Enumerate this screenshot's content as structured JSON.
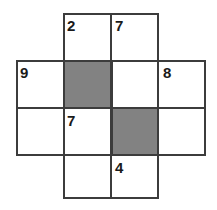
{
  "figure": {
    "name": "overlapping-blocks-number-puzzle",
    "width": 217,
    "height": 210,
    "background_color": "#ffffff",
    "line_color": "#3c3c3c",
    "dotted_line_color": "#6b6b6b",
    "shaded_cell_color": "#828282",
    "digit_color": "#1a1a1a",
    "cell_size": 47.5,
    "grid_columns": 4,
    "grid_rows": 4
  },
  "clues": [
    {
      "id": "clue-2",
      "value": "2",
      "row": 0,
      "col": 1,
      "x": 67,
      "y": 18
    },
    {
      "id": "clue-7-top",
      "value": "7",
      "row": 0,
      "col": 2,
      "x": 115,
      "y": 18
    },
    {
      "id": "clue-9",
      "value": "9",
      "row": 1,
      "col": 0,
      "x": 20,
      "y": 65
    },
    {
      "id": "clue-8",
      "value": "8",
      "row": 1,
      "col": 3,
      "x": 163,
      "y": 65
    },
    {
      "id": "clue-7-mid",
      "value": "7",
      "row": 2,
      "col": 1,
      "x": 67,
      "y": 113
    },
    {
      "id": "clue-4",
      "value": "4",
      "row": 3,
      "col": 2,
      "x": 115,
      "y": 160
    }
  ],
  "shaded_cells": [
    {
      "id": "shaded-cell-upper-left",
      "row": 1,
      "col": 1,
      "x": 63,
      "y": 60,
      "w": 48,
      "h": 48
    },
    {
      "id": "shaded-cell-lower-right",
      "row": 2,
      "col": 2,
      "x": 111,
      "y": 108,
      "w": 48,
      "h": 48
    }
  ],
  "blocks": [
    {
      "id": "block-top",
      "label": "top-block",
      "x": 63,
      "y": 13,
      "w": 96,
      "h": 96
    },
    {
      "id": "block-left",
      "label": "left-block",
      "x": 16,
      "y": 60,
      "w": 96,
      "h": 96
    },
    {
      "id": "block-right",
      "label": "right-block",
      "x": 111,
      "y": 60,
      "w": 95,
      "h": 96
    },
    {
      "id": "block-bottom",
      "label": "bottom-block",
      "x": 63,
      "y": 107,
      "w": 96,
      "h": 92
    }
  ],
  "solid_separators": [
    {
      "id": "sep-top-vertical",
      "orientation": "v",
      "x": 110,
      "y": 13,
      "len": 96
    },
    {
      "id": "sep-bottom-vertical",
      "orientation": "v",
      "x": 110,
      "y": 107,
      "len": 92
    },
    {
      "id": "sep-left-horizontal",
      "orientation": "h",
      "x": 16,
      "y": 107,
      "len": 96
    },
    {
      "id": "sep-right-horizontal",
      "orientation": "h",
      "x": 111,
      "y": 107,
      "len": 95
    }
  ],
  "dotted_separators": [
    {
      "id": "dot-left-horizontal",
      "orientation": "h",
      "x": 16,
      "y": 107,
      "len": 48
    },
    {
      "id": "dot-right-horizontal",
      "orientation": "h",
      "x": 110,
      "y": 60,
      "len": 96
    },
    {
      "id": "dot-bottom-horizontal",
      "orientation": "h",
      "x": 63,
      "y": 155,
      "len": 48
    },
    {
      "id": "dot-bottom-vertical",
      "orientation": "v",
      "x": 158,
      "y": 155,
      "len": 44
    }
  ]
}
